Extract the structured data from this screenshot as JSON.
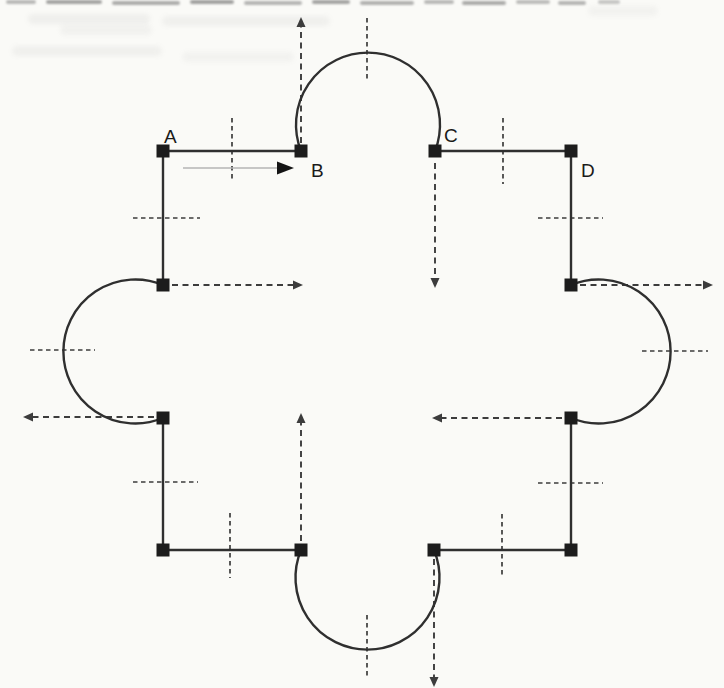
{
  "figure": {
    "colors": {
      "paper": "#fafaf7",
      "line": "#2f2f2f",
      "dashed": "#3c3c3c",
      "square": "#1c1c1c",
      "label": "#1a1a1a",
      "travel_line": "#b5b5b5",
      "travel_head": "#141414"
    },
    "stroke": {
      "shape": 2.4,
      "dash": 1.9,
      "tick": 1.7
    },
    "arc_radius": 72,
    "label_font_size": 19,
    "vertex_labels": [
      {
        "text": "A",
        "x": 164,
        "y": 143
      },
      {
        "text": "B",
        "x": 311,
        "y": 177
      },
      {
        "text": "C",
        "x": 444,
        "y": 142
      },
      {
        "text": "D",
        "x": 581,
        "y": 177
      }
    ],
    "vertices": [
      [
        163,
        151
      ],
      [
        301,
        151
      ],
      [
        435,
        151
      ],
      [
        571,
        151
      ],
      [
        163,
        285
      ],
      [
        571,
        285
      ],
      [
        163,
        418
      ],
      [
        571,
        418
      ],
      [
        163,
        550
      ],
      [
        301,
        550
      ],
      [
        434,
        550
      ],
      [
        571,
        550
      ]
    ],
    "segments": [
      [
        163,
        151,
        301,
        151
      ],
      [
        435,
        151,
        571,
        151
      ],
      [
        163,
        151,
        163,
        285
      ],
      [
        571,
        151,
        571,
        285
      ],
      [
        163,
        418,
        163,
        550
      ],
      [
        571,
        418,
        571,
        550
      ],
      [
        163,
        550,
        301,
        550
      ],
      [
        434,
        550,
        571,
        550
      ]
    ],
    "arcs": [
      {
        "x1": 301,
        "y1": 151,
        "x2": 435,
        "y2": 151,
        "sweep": 1
      },
      {
        "x1": 571,
        "y1": 285,
        "x2": 571,
        "y2": 418,
        "sweep": 1
      },
      {
        "x1": 163,
        "y1": 285,
        "x2": 163,
        "y2": 418,
        "sweep": 0
      },
      {
        "x1": 301,
        "y1": 550,
        "x2": 434,
        "y2": 550,
        "sweep": 0
      }
    ],
    "dashed_arrows": [
      [
        301,
        143,
        301,
        17
      ],
      [
        435,
        163,
        435,
        288
      ],
      [
        172,
        285,
        303,
        285
      ],
      [
        580,
        285,
        713,
        285
      ],
      [
        154,
        417,
        23,
        417
      ],
      [
        562,
        418,
        432,
        418
      ],
      [
        301,
        541,
        301,
        413
      ],
      [
        434,
        559,
        434,
        687
      ]
    ],
    "midpoint_ticks": [
      [
        232,
        118,
        232,
        181
      ],
      [
        503,
        118,
        503,
        184
      ],
      [
        133,
        218,
        200,
        218
      ],
      [
        538,
        218,
        603,
        218
      ],
      [
        367,
        18,
        367,
        80
      ],
      [
        30,
        350,
        95,
        350
      ],
      [
        642,
        351,
        708,
        351
      ],
      [
        367,
        615,
        367,
        678
      ],
      [
        133,
        482,
        198,
        482
      ],
      [
        538,
        483,
        603,
        483
      ],
      [
        230,
        513,
        230,
        578
      ],
      [
        502,
        514,
        502,
        578
      ]
    ],
    "travel_arrow": [
      183,
      168,
      294,
      168
    ]
  }
}
